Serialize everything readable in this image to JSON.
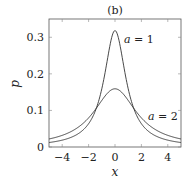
{
  "chart_data": {
    "type": "line",
    "title": "(b)",
    "xlabel": "x",
    "ylabel": "p",
    "xlim": [
      -5,
      5
    ],
    "ylim": [
      0,
      0.35
    ],
    "xticks": [
      -4,
      -2,
      0,
      2,
      4
    ],
    "xtick_labels": [
      "−4",
      "−2",
      "0",
      "2",
      "4"
    ],
    "yticks": [
      0,
      0.1,
      0.2,
      0.3
    ],
    "ytick_labels": [
      "0",
      "0.1",
      "0.2",
      "0.3"
    ],
    "grid": false,
    "series": [
      {
        "name": "a = 1",
        "a": 1,
        "x": [
          -5,
          -4,
          -3,
          -2,
          -1.5,
          -1,
          -0.5,
          0,
          0.5,
          1,
          1.5,
          2,
          3,
          4,
          5
        ],
        "values": [
          0.012,
          0.019,
          0.032,
          0.064,
          0.098,
          0.159,
          0.255,
          0.318,
          0.255,
          0.159,
          0.098,
          0.064,
          0.032,
          0.019,
          0.012
        ]
      },
      {
        "name": "a = 2",
        "a": 2,
        "x": [
          -5,
          -4,
          -3,
          -2,
          -1.5,
          -1,
          -0.5,
          0,
          0.5,
          1,
          1.5,
          2,
          3,
          4,
          5
        ],
        "values": [
          0.022,
          0.032,
          0.049,
          0.08,
          0.102,
          0.127,
          0.15,
          0.159,
          0.15,
          0.127,
          0.102,
          0.08,
          0.049,
          0.032,
          0.022
        ]
      }
    ],
    "annotations": [
      {
        "text": "a = 1",
        "x": 1.6,
        "y": 0.3
      },
      {
        "text": "a = 2",
        "x": 3.4,
        "y": 0.1
      }
    ]
  }
}
